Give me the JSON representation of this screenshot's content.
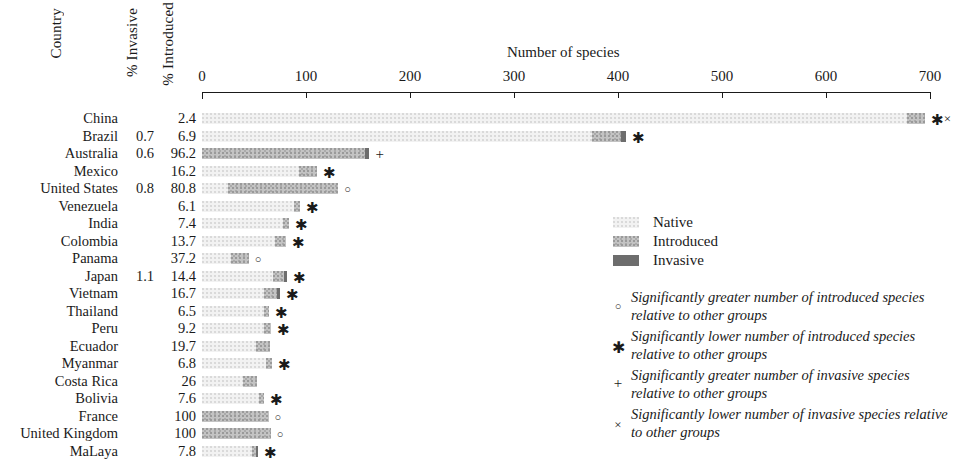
{
  "headers": {
    "country": "Country",
    "pct_invasive": "% Invasive",
    "pct_introduced": "% Introduced"
  },
  "axis": {
    "title": "Number of species",
    "ticks": [
      0,
      100,
      200,
      300,
      400,
      500,
      600,
      700
    ],
    "min": 0,
    "max": 700
  },
  "legend": {
    "items": [
      {
        "label": "Native",
        "color": "#f2f2f2"
      },
      {
        "label": "Introduced",
        "color": "#c3c3c3"
      },
      {
        "label": "Invasive",
        "color": "#6d6d6d"
      }
    ]
  },
  "marker_legend": [
    {
      "symbol": "○",
      "kind": "circle",
      "text": "Significantly greater number of introduced species relative to other groups"
    },
    {
      "symbol": "✱",
      "kind": "star",
      "text": "Significantly lower number of introduced species relative to other groups"
    },
    {
      "symbol": "+",
      "kind": "plus",
      "text": "Significantly greater number of invasive species relative to other groups"
    },
    {
      "symbol": "×",
      "kind": "cross",
      "text": "Significantly lower number of invasive species relative to other groups"
    }
  ],
  "chart_data": {
    "type": "bar",
    "orientation": "horizontal",
    "stacked": true,
    "title": "Number of species",
    "xlabel": "Number of species",
    "ylabel": "Country",
    "xlim": [
      0,
      700
    ],
    "xticks": [
      0,
      100,
      200,
      300,
      400,
      500,
      600,
      700
    ],
    "grid": false,
    "legend_position": "right-middle",
    "categories": [
      "China",
      "Brazil",
      "Australia",
      "Mexico",
      "United States",
      "Venezuela",
      "India",
      "Colombia",
      "Panama",
      "Japan",
      "Vietnam",
      "Thailand",
      "Peru",
      "Ecuador",
      "Myanmar",
      "Costa Rica",
      "Bolivia",
      "France",
      "United Kingdom",
      "MaLaya"
    ],
    "series": [
      {
        "name": "Native",
        "color": "#f2f2f2",
        "values": [
          678,
          375,
          0,
          93,
          25,
          88,
          78,
          70,
          28,
          68,
          60,
          60,
          60,
          52,
          62,
          39,
          55,
          0,
          0,
          48
        ]
      },
      {
        "name": "Introduced",
        "color": "#c3c3c3",
        "values": [
          17,
          28,
          157,
          18,
          106,
          6,
          6,
          11,
          17,
          11,
          12,
          4,
          6,
          13,
          5,
          14,
          5,
          64,
          66,
          4
        ]
      },
      {
        "name": "Invasive",
        "color": "#6d6d6d",
        "values": [
          0,
          5,
          4,
          0,
          0,
          0,
          0,
          0,
          0,
          3,
          3,
          0,
          0,
          0,
          0,
          0,
          0,
          0,
          0,
          2
        ]
      }
    ],
    "annotations": [
      {
        "category": "China",
        "symbols": [
          "✱",
          "×"
        ]
      },
      {
        "category": "Brazil",
        "symbols": [
          "✱"
        ]
      },
      {
        "category": "Australia",
        "symbols": [
          "+"
        ]
      },
      {
        "category": "Mexico",
        "symbols": [
          "✱"
        ]
      },
      {
        "category": "United States",
        "symbols": [
          "○"
        ]
      },
      {
        "category": "Venezuela",
        "symbols": [
          "✱"
        ]
      },
      {
        "category": "India",
        "symbols": [
          "✱"
        ]
      },
      {
        "category": "Colombia",
        "symbols": [
          "✱"
        ]
      },
      {
        "category": "Panama",
        "symbols": [
          "○"
        ]
      },
      {
        "category": "Japan",
        "symbols": [
          "✱"
        ]
      },
      {
        "category": "Vietnam",
        "symbols": [
          "✱"
        ]
      },
      {
        "category": "Thailand",
        "symbols": [
          "✱"
        ]
      },
      {
        "category": "Peru",
        "symbols": [
          "✱"
        ]
      },
      {
        "category": "Ecuador",
        "symbols": []
      },
      {
        "category": "Myanmar",
        "symbols": [
          "✱"
        ]
      },
      {
        "category": "Costa Rica",
        "symbols": []
      },
      {
        "category": "Bolivia",
        "symbols": [
          "✱"
        ]
      },
      {
        "category": "France",
        "symbols": [
          "○"
        ]
      },
      {
        "category": "United Kingdom",
        "symbols": [
          "○"
        ]
      },
      {
        "category": "MaLaya",
        "symbols": [
          "✱"
        ]
      }
    ]
  },
  "rows": [
    {
      "country": "China",
      "pct_invasive": "",
      "pct_introduced": "2.4"
    },
    {
      "country": "Brazil",
      "pct_invasive": "0.7",
      "pct_introduced": "6.9"
    },
    {
      "country": "Australia",
      "pct_invasive": "0.6",
      "pct_introduced": "96.2"
    },
    {
      "country": "Mexico",
      "pct_invasive": "",
      "pct_introduced": "16.2"
    },
    {
      "country": "United States",
      "pct_invasive": "0.8",
      "pct_introduced": "80.8"
    },
    {
      "country": "Venezuela",
      "pct_invasive": "",
      "pct_introduced": "6.1"
    },
    {
      "country": "India",
      "pct_invasive": "",
      "pct_introduced": "7.4"
    },
    {
      "country": "Colombia",
      "pct_invasive": "",
      "pct_introduced": "13.7"
    },
    {
      "country": "Panama",
      "pct_invasive": "",
      "pct_introduced": "37.2"
    },
    {
      "country": "Japan",
      "pct_invasive": "1.1",
      "pct_introduced": "14.4"
    },
    {
      "country": "Vietnam",
      "pct_invasive": "",
      "pct_introduced": "16.7"
    },
    {
      "country": "Thailand",
      "pct_invasive": "",
      "pct_introduced": "6.5"
    },
    {
      "country": "Peru",
      "pct_invasive": "",
      "pct_introduced": "9.2"
    },
    {
      "country": "Ecuador",
      "pct_invasive": "",
      "pct_introduced": "19.7"
    },
    {
      "country": "Myanmar",
      "pct_invasive": "",
      "pct_introduced": "6.8"
    },
    {
      "country": "Costa Rica",
      "pct_invasive": "",
      "pct_introduced": "26"
    },
    {
      "country": "Bolivia",
      "pct_invasive": "",
      "pct_introduced": "7.6"
    },
    {
      "country": "France",
      "pct_invasive": "",
      "pct_introduced": "100"
    },
    {
      "country": "United Kingdom",
      "pct_invasive": "",
      "pct_introduced": "100"
    },
    {
      "country": "MaLaya",
      "pct_invasive": "",
      "pct_introduced": "7.8"
    }
  ]
}
